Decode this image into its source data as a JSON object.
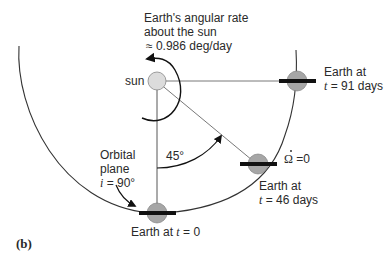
{
  "figure": {
    "panel_label": "(b)",
    "sun_label": "sun",
    "rate_label": {
      "line1": "Earth's angular rate",
      "line2": "about the sun",
      "line3": "≈ 0.986 deg/day"
    },
    "angle_label": "45°",
    "orbital_plane": {
      "line1": "Orbital",
      "line2": "plane",
      "line3_var": "i",
      "line3_rest": " = 90°"
    },
    "earth_positions": [
      {
        "line1": "Earth at ",
        "var": "t",
        "rest": " = 0"
      },
      {
        "line1": "Earth at",
        "var": "t",
        "rest": " = 46 days"
      },
      {
        "line1": "Earth at",
        "var": "t",
        "rest": " = 91 days"
      }
    ],
    "omega_dot_label": "Ω",
    "omega_dot_value": " =0",
    "colors": {
      "earth_fill": "#a6a6a6",
      "sun_fill": "#dcdcdc",
      "line": "#333333",
      "bar": "#111111"
    }
  }
}
